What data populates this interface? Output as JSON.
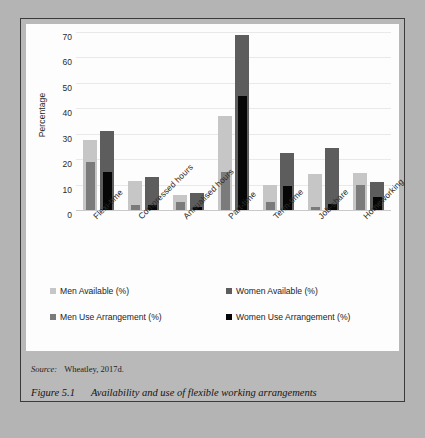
{
  "figure": {
    "source_label": "Source:",
    "source_text": "Wheatley, 2017d.",
    "caption_number": "Figure 5.1",
    "caption_text": "Availability and use of flexible working arrangements"
  },
  "chart_data": {
    "type": "bar",
    "title": "",
    "xlabel": "",
    "ylabel": "Percentage",
    "ylim": [
      0,
      70
    ],
    "yticks": [
      0,
      10,
      20,
      30,
      40,
      50,
      60,
      70
    ],
    "grid": true,
    "legend_position": "bottom",
    "bar_mode": "overlay",
    "categories": [
      "Flexi-time",
      "Compressed hours",
      "Annualised hours",
      "Part-time",
      "Term-time",
      "Job-share",
      "Homeworking"
    ],
    "series": [
      {
        "name": "Men Available (%)",
        "key": "avail-m",
        "color": "#c6c6c6",
        "values": [
          27.5,
          11.5,
          6,
          37,
          10,
          14,
          14.5
        ]
      },
      {
        "name": "Men Use Arrangement (%)",
        "key": "use-m",
        "color": "#7b7b7b",
        "values": [
          19,
          2,
          3,
          15,
          3,
          1,
          10
        ]
      },
      {
        "name": "Women Available (%)",
        "key": "avail-w",
        "color": "#5d5d5d",
        "values": [
          31,
          13,
          6.5,
          69,
          22.5,
          24.5,
          11
        ]
      },
      {
        "name": "Women Use Arrangement (%)",
        "key": "use-w",
        "color": "#060606",
        "values": [
          15,
          2,
          1,
          45,
          9.5,
          2.5,
          5
        ]
      }
    ]
  }
}
